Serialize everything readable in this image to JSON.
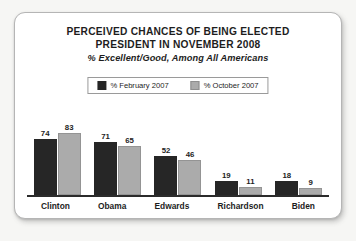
{
  "chart_data": {
    "type": "bar",
    "title": "PERCEIVED CHANCES OF BEING ELECTED PRESIDENT IN NOVEMBER 2008",
    "title_lines": [
      "PERCEIVED CHANCES OF BEING ELECTED",
      "PRESIDENT IN NOVEMBER 2008"
    ],
    "subtitle": "% Excellent/Good, Among All Americans",
    "categories": [
      "Clinton",
      "Obama",
      "Edwards",
      "Richardson",
      "Biden"
    ],
    "series": [
      {
        "name": "% February 2007",
        "color": "#262626",
        "values": [
          74,
          71,
          52,
          19,
          18
        ]
      },
      {
        "name": "% October 2007",
        "color": "#ababab",
        "values": [
          83,
          65,
          46,
          11,
          9
        ]
      }
    ],
    "xlabel": "",
    "ylabel": "",
    "ylim": [
      0,
      100
    ],
    "grid": false,
    "axis": {
      "baseline": true,
      "y_axis_visible": false,
      "tick_labels": false
    },
    "legend": {
      "position": "top-center",
      "bordered": true
    },
    "data_labels": true
  },
  "legend": {
    "entries": [
      {
        "label": "% February 2007",
        "swatch": "dark-swatch-icon"
      },
      {
        "label": "% October 2007",
        "swatch": "gray-swatch-icon"
      }
    ]
  },
  "colors": {
    "series_dark": "#262626",
    "series_gray": "#ababab",
    "card_background": "#ffffff",
    "page_background": "#f6f6f4",
    "text": "#1d1d1d",
    "axis": "#2b2b2b",
    "border": "#b5b5b5"
  }
}
